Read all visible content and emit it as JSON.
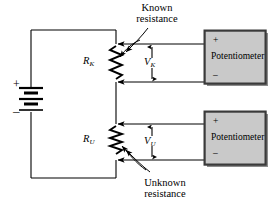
{
  "figure": {
    "type": "circuit-diagram",
    "background_color": "#ffffff",
    "line_color": "#000000"
  },
  "annotations": {
    "known": {
      "line1": "Known",
      "line2": "resistance"
    },
    "unknown": {
      "line1": "Unknown",
      "line2": "resistance"
    }
  },
  "components": {
    "battery": {
      "name": "battery",
      "plus": "+",
      "minus": "–"
    },
    "resistor_known": {
      "name": "known-resistance",
      "symbol_base": "R",
      "symbol_sub": "K",
      "kind": "variable-resistor"
    },
    "resistor_unknown": {
      "name": "unknown-resistance",
      "symbol_base": "R",
      "symbol_sub": "U",
      "kind": "variable-resistor"
    },
    "voltage_known": {
      "symbol_base": "V",
      "symbol_sub": "K"
    },
    "voltage_unknown": {
      "symbol_base": "V",
      "symbol_sub": "U"
    }
  },
  "instruments": [
    {
      "name": "potentiometer-top",
      "label": "Potentiometer",
      "plus": "+",
      "minus": "–",
      "fill_color": "#c9c9c9",
      "border_color": "#3a3a3a"
    },
    {
      "name": "potentiometer-bottom",
      "label": "Potentiometer",
      "plus": "+",
      "minus": "–",
      "fill_color": "#c9c9c9",
      "border_color": "#3a3a3a"
    }
  ]
}
